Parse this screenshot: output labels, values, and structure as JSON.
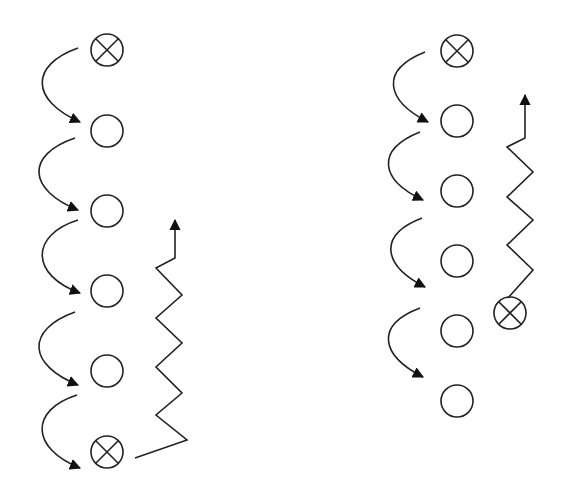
{
  "diagram": {
    "colors": {
      "stroke": "#222222",
      "background": "#ffffff"
    },
    "left_formation": {
      "column_x": 107,
      "players": [
        {
          "y": 50,
          "type": "x-marked"
        },
        {
          "y": 131,
          "type": "open"
        },
        {
          "y": 211,
          "type": "open"
        },
        {
          "y": 291,
          "type": "open"
        },
        {
          "y": 371,
          "type": "open"
        },
        {
          "y": 452,
          "type": "x-marked"
        }
      ],
      "pass_arrows": 5,
      "zigzag_run": {
        "from": [
          135,
          458
        ],
        "to": [
          175,
          215
        ]
      }
    },
    "right_formation": {
      "column_x": 457,
      "players": [
        {
          "y": 51,
          "type": "x-marked"
        },
        {
          "y": 121,
          "type": "open"
        },
        {
          "y": 191,
          "type": "open"
        },
        {
          "y": 261,
          "type": "open"
        },
        {
          "y": 331,
          "type": "open"
        },
        {
          "y": 401,
          "type": "open"
        }
      ],
      "runner": {
        "x": 510,
        "y": 313,
        "type": "x-marked"
      },
      "pass_arrows": 4,
      "zigzag_run": {
        "from": [
          510,
          298
        ],
        "to": [
          523,
          90
        ]
      }
    }
  }
}
